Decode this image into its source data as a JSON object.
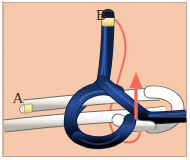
{
  "figure": {
    "kind": "knot-tying-instruction-diagram",
    "canvas": {
      "width": 190,
      "height": 160
    }
  },
  "colors": {
    "background": "#f7c9ac",
    "background_shadow": "#eebb9c",
    "border_outer": "#ffffff",
    "border_inner": "#c9a48f",
    "rope_navy": "#1d3c7e",
    "rope_navy_dark": "#10244f",
    "rope_navy_highlight": "#3a5ca8",
    "rope_white": "#fbfbf9",
    "rope_white_shade": "#cfcdc8",
    "rope_white_outline": "#6d6a64",
    "tip_band": "#f2eca0",
    "tip_band_edge": "#c9c06a",
    "tip_cap": "#13162c",
    "arrow_red": "#f26a5a",
    "label_text": "#3a2a1e"
  },
  "labels": [
    {
      "id": "label-b",
      "text": "B",
      "x": 101,
      "y": 20,
      "size": 15,
      "desc": "navy rope working end label"
    },
    {
      "id": "label-a",
      "text": "A",
      "x": 18,
      "y": 103,
      "size": 15,
      "desc": "white rope end label"
    }
  ],
  "annotations": {
    "arrow": {
      "name": "pull-direction-arrow",
      "color": "#f26a5a",
      "meaning": "pull the navy working end B in this direction",
      "points_to": "up"
    }
  },
  "ropes": [
    {
      "id": "rope-navy",
      "name": "navy-rope",
      "color": "#1d3c7e",
      "end_label": "B",
      "tip": {
        "band_color": "#f2eca0",
        "cap_color": "#13162c"
      }
    },
    {
      "id": "rope-white",
      "name": "white-rope",
      "color": "#fbfbf9",
      "end_label": "A",
      "tip": {
        "band_color": "#f2eca0",
        "cap_color": "#cfcdc8"
      }
    }
  ]
}
